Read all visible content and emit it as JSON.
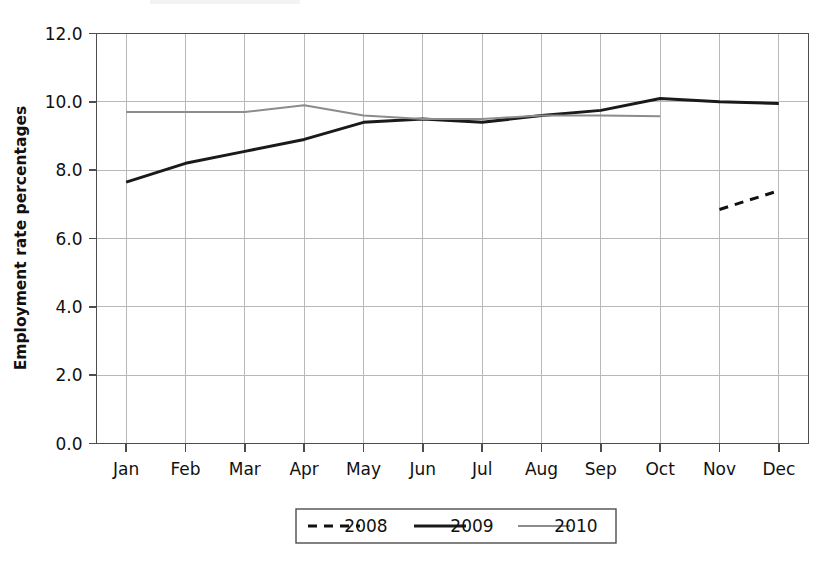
{
  "chart_data": {
    "type": "line",
    "title": "",
    "xlabel": "",
    "ylabel": "Employment rate percentages",
    "categories": [
      "Jan",
      "Feb",
      "Mar",
      "Apr",
      "May",
      "Jun",
      "Jul",
      "Aug",
      "Sep",
      "Oct",
      "Nov",
      "Dec"
    ],
    "ylim": [
      0.0,
      12.0
    ],
    "ytick_step": 2.0,
    "ytick_labels": [
      "0.0",
      "2.0",
      "4.0",
      "6.0",
      "8.0",
      "10.0",
      "12.0"
    ],
    "ytick_values": [
      0.0,
      2.0,
      4.0,
      6.0,
      8.0,
      10.0,
      12.0
    ],
    "grid": true,
    "grid_axes": "both",
    "legend_position": "bottom-center",
    "series": [
      {
        "name": "2008",
        "style": "dashed",
        "color": "#111111",
        "width": 3.0,
        "dash": "9,7",
        "values": [
          null,
          null,
          null,
          null,
          null,
          null,
          null,
          null,
          null,
          null,
          6.85,
          7.4
        ]
      },
      {
        "name": "2009",
        "style": "solid",
        "color": "#1a1a1a",
        "width": 3.0,
        "dash": "",
        "values": [
          7.65,
          8.2,
          8.55,
          8.9,
          9.4,
          9.5,
          9.4,
          9.6,
          9.75,
          10.1,
          10.0,
          9.95
        ]
      },
      {
        "name": "2010",
        "style": "solid",
        "color": "#8c8c8c",
        "width": 2.0,
        "dash": "",
        "values": [
          9.7,
          9.7,
          9.7,
          9.9,
          9.6,
          9.5,
          9.5,
          9.6,
          9.6,
          9.58,
          null,
          null
        ]
      }
    ]
  },
  "legend": {
    "entries": [
      {
        "label": "2008"
      },
      {
        "label": "2009"
      },
      {
        "label": "2010"
      }
    ]
  },
  "colors": {
    "background": "#ffffff",
    "axis": "#4d4d4d",
    "grid": "#b8b8b8",
    "series_2008": "#111111",
    "series_2009": "#1a1a1a",
    "series_2010": "#8c8c8c",
    "text": "#111111"
  }
}
